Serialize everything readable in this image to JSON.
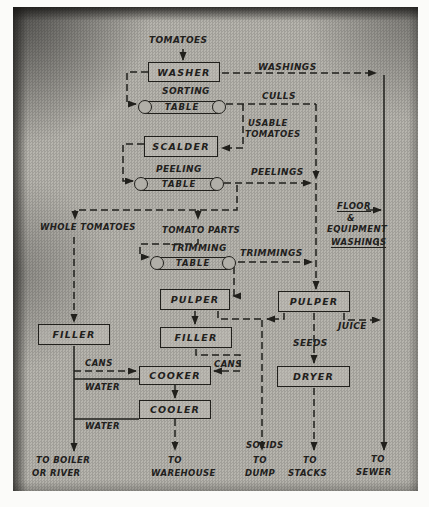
{
  "figure": {
    "nodes": {
      "washer": "WASHER",
      "scalder": "SCALDER",
      "pulper_center": "PULPER",
      "pulper_right": "PULPER",
      "filler_left": "FILLER",
      "filler_center": "FILLER",
      "cooker": "COOKER",
      "cooler": "COOLER",
      "dryer": "DRYER"
    },
    "conveyors": {
      "sorting": {
        "label": "SORTING",
        "table": "TABLE"
      },
      "peeling": {
        "label": "PEELING",
        "table": "TABLE"
      },
      "trimming": {
        "label": "TRIMMING",
        "table": "TABLE"
      }
    },
    "flows": {
      "tomatoes": "TOMATOES",
      "washings": "WASHINGS",
      "culls": "CULLS",
      "usable_line1": "USABLE",
      "usable_line2": "TOMATOES",
      "peelings": "PEELINGS",
      "whole_tomatoes": "WHOLE TOMATOES",
      "tomato_parts": "TOMATO PARTS",
      "trimmings": "TRIMMINGS",
      "floor_line1": "FLOOR",
      "floor_line2": "&",
      "floor_line3": "EQUIPMENT",
      "floor_line4": "WASHINGS",
      "juice": "JUICE",
      "seeds": "SEEDS",
      "cans_left": "CANS",
      "cans_right": "CANS",
      "water_cooker": "WATER",
      "water_cooler": "WATER",
      "solids": "SOLIDS"
    },
    "outputs": {
      "boiler_line1": "TO BOILER",
      "boiler_line2": "OR RIVER",
      "warehouse_line1": "TO",
      "warehouse_line2": "WAREHOUSE",
      "dump_line1": "TO",
      "dump_line2": "DUMP",
      "stacks_line1": "TO",
      "stacks_line2": "STACKS",
      "sewer_line1": "TO",
      "sewer_line2": "SEWER"
    },
    "colors": {
      "ink": "#21201c",
      "paper": "#b1afa8"
    }
  }
}
